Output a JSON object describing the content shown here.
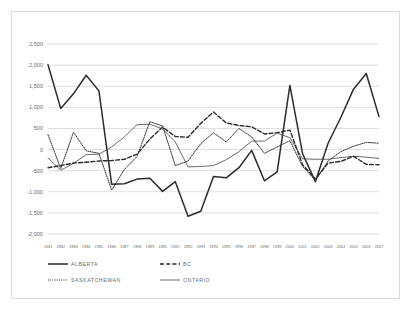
{
  "chart_data": {
    "type": "line",
    "title": "",
    "xlabel": "",
    "ylabel": "",
    "ylim": [
      -2000,
      2500
    ],
    "yticks": [
      2500,
      2000,
      1500,
      1000,
      500,
      0,
      -500,
      -1000,
      -1500,
      -2000
    ],
    "ytick_labels": [
      "2,500",
      "2,000",
      "1,500",
      "1,000",
      "500",
      "0",
      "-500",
      "-1,000",
      "-1,500",
      "-2,000"
    ],
    "grid": true,
    "legend_position": "bottom-left",
    "x": [
      1981,
      1982,
      1983,
      1984,
      1985,
      1986,
      1987,
      1988,
      1989,
      1990,
      1991,
      1992,
      1993,
      1994,
      1995,
      1996,
      1997,
      1998,
      1999,
      2000,
      2001,
      2002,
      2003,
      2004,
      2005,
      2006,
      2007
    ],
    "categories": [
      "1981",
      "1982",
      "1983",
      "1984",
      "1985",
      "1986",
      "1987",
      "1988",
      "1989",
      "1990",
      "1991",
      "1992",
      "1993",
      "1994",
      "1995",
      "1996",
      "1997",
      "1998",
      "1999",
      "2000",
      "2001",
      "2002",
      "2003",
      "2004",
      "2005",
      "2006",
      "2007"
    ],
    "series": [
      {
        "name": "ALBERTA",
        "style": "solid-thick",
        "values": [
          2010,
          975,
          1320,
          1760,
          1390,
          -820,
          -810,
          -700,
          -680,
          -990,
          -760,
          -1580,
          -1460,
          -640,
          -670,
          -430,
          -20,
          -740,
          -530,
          1520,
          -100,
          -760,
          150,
          760,
          1430,
          1800,
          780
        ]
      },
      {
        "name": "BC",
        "style": "dashed",
        "values": [
          -430,
          -380,
          -320,
          -300,
          -270,
          -260,
          -230,
          -110,
          250,
          530,
          310,
          290,
          620,
          890,
          630,
          570,
          540,
          370,
          400,
          460,
          -360,
          -700,
          -320,
          -280,
          -160,
          -350,
          -360
        ]
      },
      {
        "name": "SASKATCHEWAN",
        "style": "dotted",
        "values": [
          350,
          -450,
          410,
          -30,
          -90,
          -960,
          -470,
          -160,
          660,
          560,
          -380,
          -270,
          140,
          400,
          180,
          500,
          300,
          -90,
          60,
          210,
          -400,
          -730,
          -270,
          -50,
          80,
          170,
          150
        ]
      },
      {
        "name": "ONTARIO",
        "style": "solid-thin",
        "values": [
          -200,
          -490,
          -330,
          -120,
          -110,
          60,
          300,
          590,
          600,
          490,
          180,
          -410,
          -400,
          -380,
          -240,
          -50,
          200,
          200,
          390,
          280,
          -220,
          -230,
          -230,
          -190,
          -160,
          -180,
          -210
        ]
      }
    ]
  },
  "legend": {
    "items": [
      {
        "label": "ALBERTA",
        "style": "solid-thick"
      },
      {
        "label": "BC",
        "style": "dashed"
      },
      {
        "label": "SASKATCHEWAN",
        "style": "dotted"
      },
      {
        "label": "ONTARIO",
        "style": "solid-thin"
      }
    ]
  }
}
